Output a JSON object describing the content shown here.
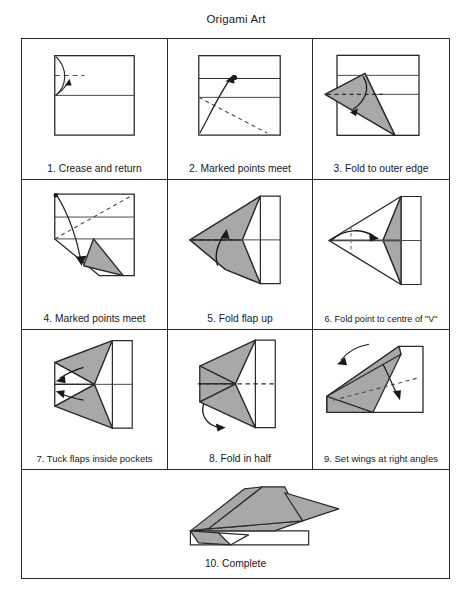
{
  "document": {
    "title": "Origami Art",
    "type": "origami-instruction-diagram",
    "subject": "paper airplane",
    "step_count": 10
  },
  "colors": {
    "paper_fill": "#ffffff",
    "shaded_fill": "#a8a8a8",
    "line": "#2a2a2a",
    "crease_dashed": "#4a4a4a",
    "background": "#ffffff",
    "text": "#1a1a1a"
  },
  "grid": {
    "rows": 4,
    "columns": 3,
    "last_row_columns": 1
  },
  "steps": [
    {
      "number": "1.",
      "caption": "1. Crease and return",
      "diagram": "square-with-horizontal-midline-dashed-crease-upper-left-curved-arrow"
    },
    {
      "number": "2.",
      "caption": "2. Marked points meet",
      "diagram": "square-two-horizontal-lines-marked-dot-arrow-dashed-diagonal"
    },
    {
      "number": "3.",
      "caption": "3. Fold to outer edge",
      "diagram": "shaded-triangle-folded-over-with-curved-arrow"
    },
    {
      "number": "4.",
      "caption": "4. Marked points meet",
      "diagram": "folded-shape-dashed-diagonal-shaded-triangle-curved-arrow"
    },
    {
      "number": "5.",
      "caption": "5. Fold flap up",
      "diagram": "arrowhead-plane-shape-shaded-with-dashed-crease-and-up-arrow"
    },
    {
      "number": "6.",
      "caption": "6. Fold point to centre of \"V\"",
      "diagram": "arrowhead-shape-with-horizontal-arrow-to-centre"
    },
    {
      "number": "7.",
      "caption": "7. Tuck flaps inside pockets",
      "diagram": "arrowhead-shape-with-two-left-pointing-tuck-arrows"
    },
    {
      "number": "8.",
      "caption": "8. Fold in half",
      "diagram": "arrowhead-shape-horizontal-dashed-centreline-with-fold-arrow"
    },
    {
      "number": "9.",
      "caption": "9. Set wings at right angles",
      "diagram": "three-quarter-view-folded-plane-with-two-wing-arrows"
    },
    {
      "number": "10.",
      "caption": "10. Complete",
      "diagram": "finished-paper-airplane-side-perspective-view"
    }
  ]
}
